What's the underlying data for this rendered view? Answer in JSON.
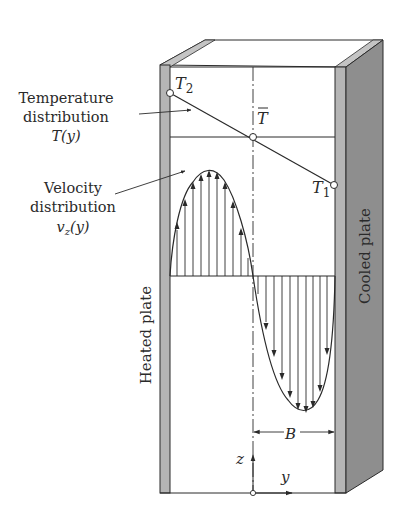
{
  "figure": {
    "labels": {
      "temperature_line1": "Temperature",
      "temperature_line2": "distribution",
      "temperature_line3": "T(y)",
      "velocity_line1": "Velocity",
      "velocity_line2": "distribution",
      "velocity_line3_base": "v",
      "velocity_line3_sub": "z",
      "velocity_line3_tail": "(y)",
      "heated_plate": "Heated plate",
      "cooled_plate": "Cooled plate",
      "t2": "T",
      "t2_sub": "2",
      "t1": "T",
      "t1_sub": "1",
      "tbar": "T",
      "b_dim": "B",
      "z_axis": "z",
      "y_axis": "y"
    },
    "colors": {
      "line": "#2a2a2a",
      "plate_face": "#b5b5b5",
      "plate_side": "#8e8e8e",
      "background": "#ffffff"
    }
  }
}
